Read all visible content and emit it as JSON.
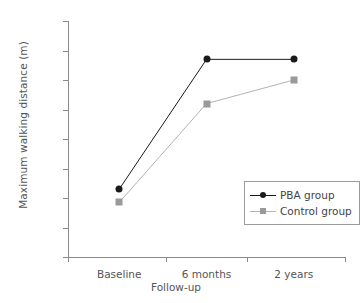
{
  "chart_data": {
    "type": "line",
    "title": "",
    "xlabel": "Follow-up",
    "ylabel": "Maximum walking distance (m)",
    "categories": [
      "Baseline",
      "6 months",
      "2 years"
    ],
    "ylim": [
      0,
      800
    ],
    "yticks": [
      0,
      100,
      200,
      300,
      400,
      500,
      600,
      700,
      800
    ],
    "ytick_labels": [
      "0",
      "100",
      "200",
      "300",
      "400",
      "500",
      "600",
      "700",
      "800"
    ],
    "grid": false,
    "legend_position": "lower-right-inside",
    "series": [
      {
        "name": "PBA group",
        "values": [
          230,
          670,
          670
        ],
        "color": "#1a1a1a",
        "marker": "circle"
      },
      {
        "name": "Control group",
        "values": [
          185,
          520,
          600
        ],
        "color": "#b3b3b3",
        "marker": "square",
        "marker_color": "#9a9a9a"
      }
    ]
  },
  "legend": {
    "items": [
      {
        "label": "PBA group"
      },
      {
        "label": "Control group"
      }
    ]
  }
}
